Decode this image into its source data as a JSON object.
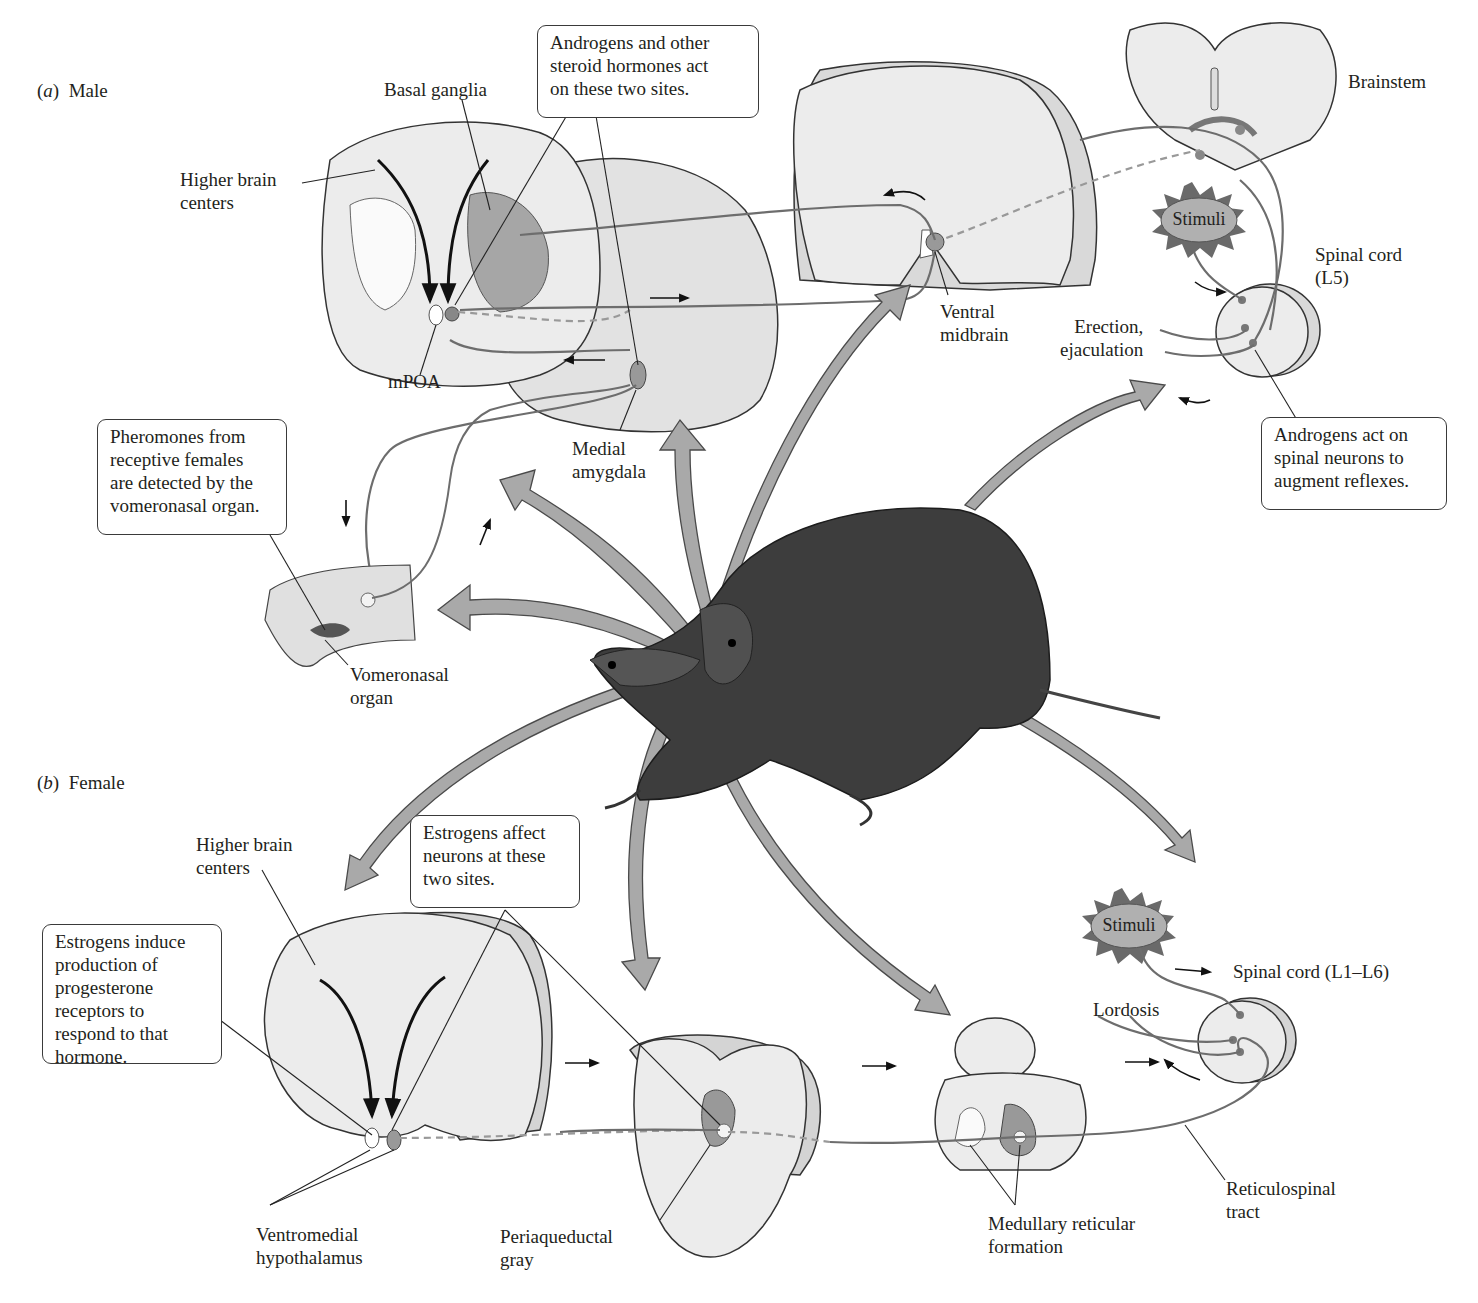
{
  "figure": {
    "panels": [
      {
        "id": "a",
        "letter": "a",
        "title": "Male"
      },
      {
        "id": "b",
        "letter": "b",
        "title": "Female"
      }
    ],
    "male": {
      "labels": {
        "basal_ganglia": "Basal ganglia",
        "higher_brain_centers": "Higher brain\ncenters",
        "mpoa": "mPOA",
        "medial_amygdala": "Medial\namygdala",
        "ventral_midbrain": "Ventral\nmidbrain",
        "brainstem": "Brainstem",
        "spinal_cord": "Spinal cord\n(L5)",
        "erection": "Erection,\nejaculation",
        "vomeronasal_organ": "Vomeronasal\norgan",
        "stimuli": "Stimuli"
      },
      "callouts": {
        "androgens_sites": "Androgens and other\nsteroid hormones act\non these two sites.",
        "pheromones": "Pheromones from\nreceptive females\nare detected by the\nvomeronasal organ.",
        "androgens_spinal": "Androgens act on\nspinal neurons to\naugment reflexes."
      }
    },
    "female": {
      "labels": {
        "higher_brain_centers": "Higher brain\ncenters",
        "ventromedial_hypothalamus": "Ventromedial\nhypothalamus",
        "periaqueductal_gray": "Periaqueductal\ngray",
        "medullary_reticular_formation": "Medullary reticular\nformation",
        "reticulospinal_tract": "Reticulospinal\ntract",
        "spinal_cord": "Spinal cord (L1–L6)",
        "lordosis": "Lordosis",
        "stimuli": "Stimuli"
      },
      "callouts": {
        "estrogens_sites": "Estrogens affect\nneurons at these\ntwo sites.",
        "estrogens_induce": "Estrogens induce\nproduction of\nprogesterone\nreceptors to\nrespond to that\nhormone."
      }
    },
    "colors": {
      "tissue_fill": "#ececec",
      "tissue_side": "#d2d2d2",
      "nucleus_fill": "#9a9a9a",
      "arrow_fill": "#a9a9a9",
      "arrow_stroke": "#4a4a4a",
      "neuron_line": "#6d6d6d",
      "rat_body": "#3a3a3a",
      "stimuli_fill": "#b0b0b0",
      "stimuli_spikes": "#6a6a6a"
    }
  }
}
